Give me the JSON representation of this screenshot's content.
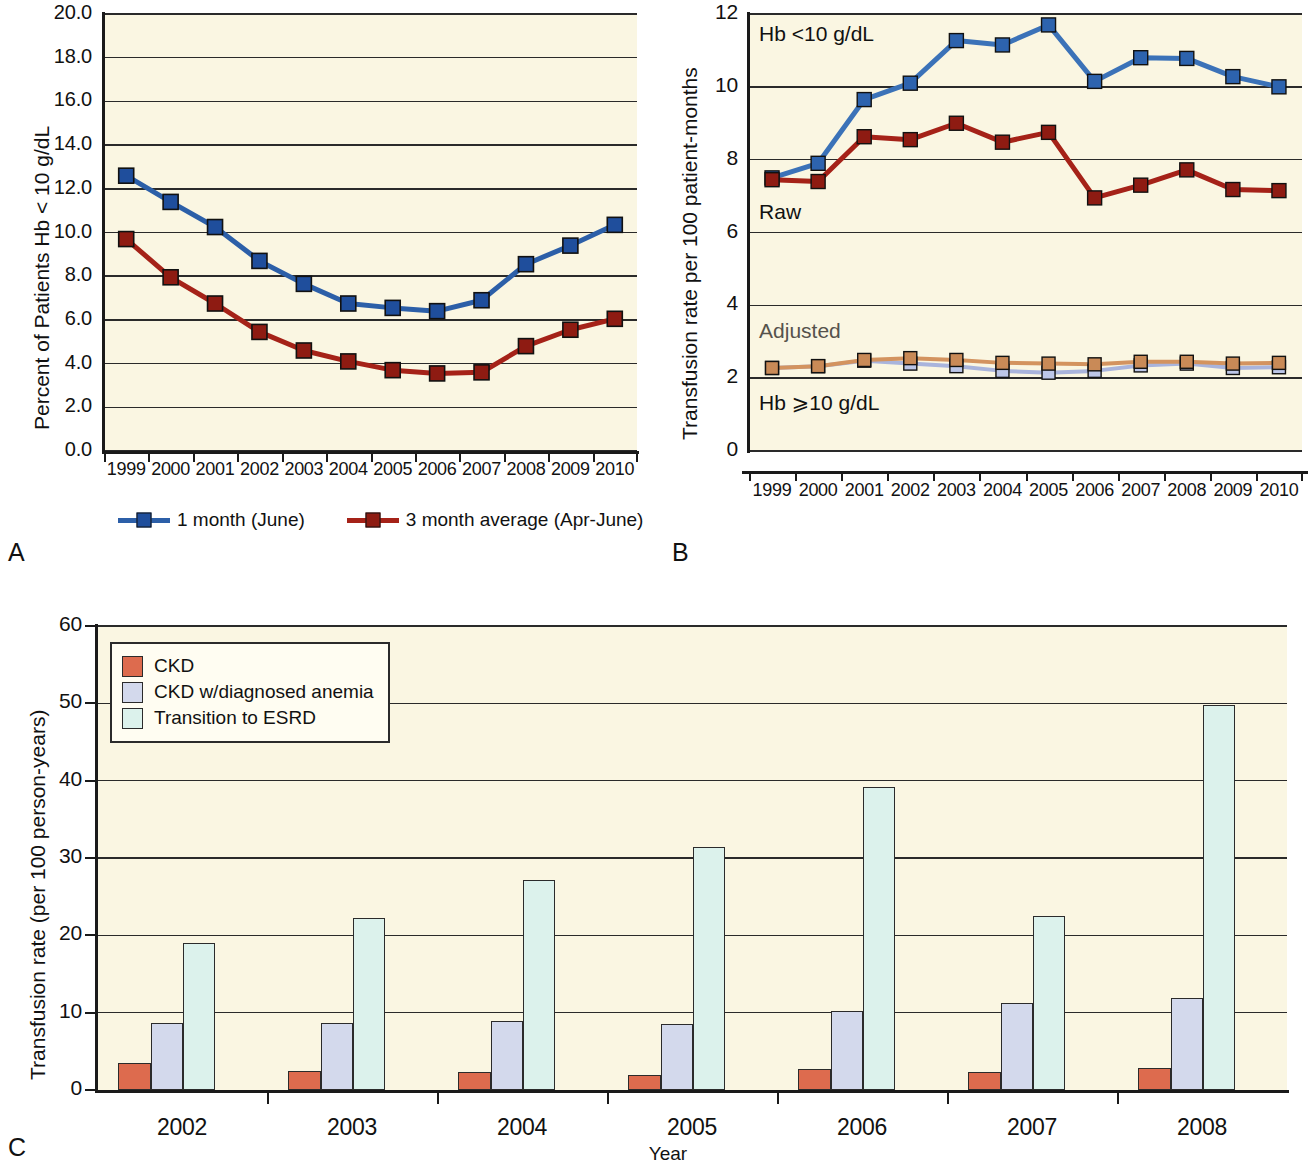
{
  "figure": {
    "panel_a_letter": "A",
    "panel_b_letter": "B",
    "panel_c_letter": "C"
  },
  "chart_data": [
    {
      "panel": "A",
      "type": "line",
      "title": "",
      "xlabel": "",
      "ylabel": "Percent of Patients Hb < 10 g/dL",
      "ylim": [
        0,
        20
      ],
      "yticks": [
        "0.0",
        "2.0",
        "4.0",
        "6.0",
        "8.0",
        "10.0",
        "12.0",
        "14.0",
        "16.0",
        "18.0",
        "20.0"
      ],
      "grid": true,
      "legend_position": "below",
      "categories": [
        "1999",
        "2000",
        "2001",
        "2002",
        "2003",
        "2004",
        "2005",
        "2006",
        "2007",
        "2008",
        "2009",
        "2010"
      ],
      "series": [
        {
          "name": "1 month (June)",
          "color": "#2C5FA8",
          "marker_color": "#1F4E9C",
          "values": [
            12.6,
            11.4,
            10.25,
            8.7,
            7.65,
            6.75,
            6.55,
            6.4,
            6.9,
            8.55,
            9.4,
            10.35
          ]
        },
        {
          "name": "3 month average (Apr-June)",
          "color": "#A52218",
          "marker_color": "#8E1B12",
          "values": [
            9.7,
            7.95,
            6.75,
            5.45,
            4.6,
            4.1,
            3.7,
            3.55,
            3.6,
            4.8,
            5.55,
            6.05
          ]
        }
      ]
    },
    {
      "panel": "B",
      "type": "line",
      "title": "",
      "xlabel": "",
      "ylabel": "Transfusion rate per 100 patient-months",
      "ylim": [
        0,
        12
      ],
      "yticks": [
        "0",
        "2",
        "4",
        "6",
        "8",
        "10",
        "12"
      ],
      "grid": true,
      "annotations": [
        {
          "text": "Hb <10 g/dL",
          "x_year": "1999",
          "y_value": 11.4,
          "style": "dark"
        },
        {
          "text": "Raw",
          "x_year": "1999",
          "y_value": 6.5,
          "style": "dark"
        },
        {
          "text": "Adjusted",
          "x_year": "1999",
          "y_value": 3.25,
          "style": "grey"
        },
        {
          "text": "Hb ⩾10 g/dL",
          "x_year": "1999",
          "y_value": 1.25,
          "style": "dark"
        }
      ],
      "categories": [
        "1999",
        "2000",
        "2001",
        "2002",
        "2003",
        "2004",
        "2005",
        "2006",
        "2007",
        "2008",
        "2009",
        "2010"
      ],
      "series": [
        {
          "name": "Hb <10 g/dL raw (blue)",
          "group": "Raw, Hb <10 g/dL",
          "color": "#3B72B8",
          "marker_color": "#2D63AE",
          "values": [
            7.5,
            7.9,
            9.65,
            10.1,
            11.27,
            11.15,
            11.7,
            10.15,
            10.8,
            10.78,
            10.28,
            10.0
          ]
        },
        {
          "name": "Hb <10 g/dL raw (red)",
          "group": "Raw, Hb <10 g/dL",
          "color": "#A52218",
          "marker_color": "#8E1B12",
          "values": [
            7.45,
            7.4,
            8.63,
            8.55,
            9.0,
            8.48,
            8.75,
            6.95,
            7.3,
            7.72,
            7.18,
            7.15
          ]
        },
        {
          "name": "Hb ⩾10 g/dL adjusted (light blue)",
          "group": "Adjusted, Hb ⩾10 g/dL",
          "color": "#A9B4DC",
          "marker_color": "#BCC6E8",
          "values": [
            2.28,
            2.33,
            2.48,
            2.4,
            2.33,
            2.2,
            2.15,
            2.2,
            2.35,
            2.4,
            2.28,
            2.3
          ]
        },
        {
          "name": "Hb ⩾10 g/dL adjusted (light orange)",
          "group": "Adjusted, Hb ⩾10 g/dL",
          "color": "#D3935F",
          "marker_color": "#C98A57",
          "values": [
            2.28,
            2.33,
            2.5,
            2.55,
            2.5,
            2.42,
            2.4,
            2.38,
            2.45,
            2.45,
            2.4,
            2.42
          ]
        }
      ]
    },
    {
      "panel": "C",
      "type": "bar",
      "title": "",
      "xlabel": "Year",
      "ylabel": "Transfusion rate (per 100 person-years)",
      "ylim": [
        0,
        60
      ],
      "yticks": [
        "0",
        "10",
        "20",
        "30",
        "40",
        "50",
        "60"
      ],
      "grid": true,
      "legend_position": "top-left",
      "categories": [
        "2002",
        "2003",
        "2004",
        "2005",
        "2006",
        "2007",
        "2008"
      ],
      "series": [
        {
          "name": "CKD",
          "color": "#DD6B4E",
          "values": [
            3.5,
            2.4,
            2.3,
            2.0,
            2.7,
            2.3,
            2.9
          ]
        },
        {
          "name": "CKD w/diagnosed anemia",
          "color": "#D3D9EC",
          "values": [
            8.6,
            8.7,
            8.9,
            8.5,
            10.2,
            11.3,
            11.9
          ]
        },
        {
          "name": "Transition to ESRD",
          "color": "#DCF2EC",
          "values": [
            19.0,
            22.2,
            27.1,
            31.4,
            39.2,
            22.5,
            49.8
          ]
        }
      ]
    }
  ]
}
